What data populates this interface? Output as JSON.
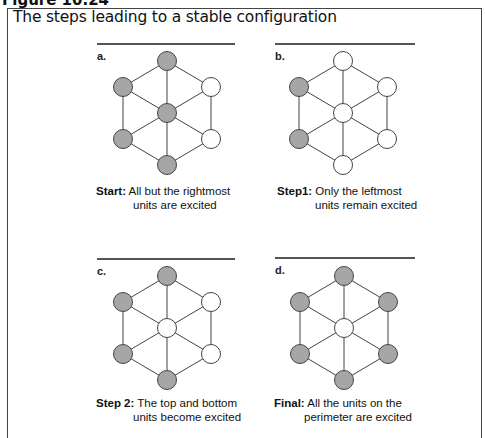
{
  "figure": {
    "label": "Figure 10.24",
    "title": "The steps leading to a stable configuration"
  },
  "colors": {
    "excited": "#a6a6a6",
    "resting": "#ffffff",
    "stroke": "#444444"
  },
  "panels": [
    {
      "letter": "a.",
      "caption_lead": "Start:",
      "caption_line1": "All but the rightmost",
      "caption_line2": "units are excited",
      "nodes": {
        "top": "excited",
        "upper_left": "excited",
        "upper_right": "resting",
        "center": "excited",
        "lower_left": "excited",
        "lower_right": "resting",
        "bottom": "excited"
      }
    },
    {
      "letter": "b.",
      "caption_lead": "Step1:",
      "caption_line1": "Only the leftmost",
      "caption_line2": "units remain excited",
      "nodes": {
        "top": "resting",
        "upper_left": "excited",
        "upper_right": "resting",
        "center": "resting",
        "lower_left": "excited",
        "lower_right": "resting",
        "bottom": "resting"
      }
    },
    {
      "letter": "c.",
      "caption_lead": "Step 2:",
      "caption_line1": "The top and bottom",
      "caption_line2": "units become excited",
      "nodes": {
        "top": "excited",
        "upper_left": "excited",
        "upper_right": "resting",
        "center": "resting",
        "lower_left": "excited",
        "lower_right": "resting",
        "bottom": "excited"
      }
    },
    {
      "letter": "d.",
      "caption_lead": "Final:",
      "caption_line1": "All the units on the",
      "caption_line2": "perimeter are excited",
      "nodes": {
        "top": "excited",
        "upper_left": "excited",
        "upper_right": "excited",
        "center": "resting",
        "lower_left": "excited",
        "lower_right": "excited",
        "bottom": "excited"
      }
    }
  ]
}
